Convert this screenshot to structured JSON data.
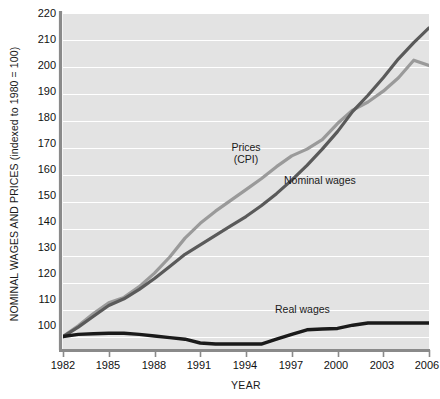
{
  "chart_data": {
    "type": "line",
    "title": "",
    "xlabel": "YEAR",
    "ylabel": "NOMINAL WAGES AND PRICES (indexed to 1980 = 100)",
    "xlim": [
      1982,
      2006
    ],
    "ylim": [
      95,
      220
    ],
    "grid": true,
    "grid_color": "#ffffff",
    "plot_background": "#e3e3e3",
    "legend_position": "inline-annotations",
    "ytick_labels": [
      "100",
      "110",
      "120",
      "130",
      "140",
      "150",
      "160",
      "170",
      "180",
      "190",
      "200",
      "210",
      "220"
    ],
    "ytick_values": [
      100,
      110,
      120,
      130,
      140,
      150,
      160,
      170,
      180,
      190,
      200,
      210,
      220
    ],
    "xtick_labels": [
      "1982",
      "1985",
      "1988",
      "1991",
      "1994",
      "1997",
      "2000",
      "2003",
      "2006"
    ],
    "xtick_values": [
      1982,
      1985,
      1988,
      1991,
      1994,
      1997,
      2000,
      2003,
      2006
    ],
    "x": [
      1982,
      1983,
      1984,
      1985,
      1986,
      1987,
      1988,
      1989,
      1990,
      1991,
      1992,
      1993,
      1994,
      1995,
      1996,
      1997,
      1998,
      1999,
      2000,
      2001,
      2002,
      2003,
      2004,
      2005,
      2006
    ],
    "series": [
      {
        "name": "Prices (CPI)",
        "label": "Prices",
        "label_line2": "(CPI)",
        "color": "#9a9a9a",
        "width": 3.2,
        "values": [
          100,
          104,
          108.5,
          112.5,
          114.5,
          118.5,
          123.5,
          129.5,
          136.5,
          142,
          146.5,
          150.5,
          154.5,
          158.5,
          163,
          167,
          169.5,
          173,
          179,
          184,
          187,
          191,
          196,
          202.5,
          200.5
        ]
      },
      {
        "name": "Nominal wages",
        "label": "Nominal wages",
        "color": "#5a5a5a",
        "width": 3.2,
        "values": [
          100,
          103.5,
          107.5,
          111.5,
          114,
          117.5,
          121.5,
          126,
          130.5,
          134,
          137.5,
          141,
          144.5,
          148.5,
          153,
          158,
          163.5,
          169.5,
          176,
          183.5,
          189.5,
          196,
          203,
          209,
          214.5
        ]
      },
      {
        "name": "Real wages",
        "label": "Real wages",
        "color": "#1a1a1a",
        "width": 3.4,
        "values": [
          100,
          100.8,
          101,
          101.2,
          101.2,
          100.8,
          100.2,
          99.6,
          99,
          97.6,
          97.2,
          97.2,
          97.2,
          97.2,
          99,
          100.8,
          102.5,
          102.8,
          103,
          104.2,
          105,
          105,
          105,
          105,
          105
        ]
      }
    ]
  },
  "annotations": {
    "prices_label_line1": "Prices",
    "prices_label_line2": "(CPI)",
    "nominal_label": "Nominal wages",
    "real_label": "Real wages"
  }
}
